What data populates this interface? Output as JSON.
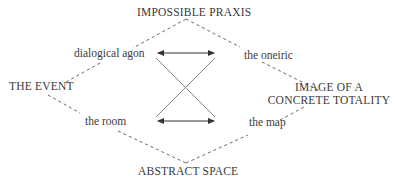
{
  "diagram": {
    "nodes": {
      "top": "IMPOSSIBLE PRAXIS",
      "left": "THE EVENT",
      "right_line1": "IMAGE OF A",
      "right_line2": "CONCRETE TOTALITY",
      "bottom": "ABSTRACT SPACE"
    },
    "edge_labels": {
      "upper_left": "dialogical agon",
      "upper_right": "the oneiric",
      "lower_left": "the room",
      "lower_right": "the map"
    },
    "edges": [
      {
        "from": "IMPOSSIBLE PRAXIS",
        "to": "THE EVENT",
        "style": "dashed",
        "label": "dialogical agon"
      },
      {
        "from": "IMPOSSIBLE PRAXIS",
        "to": "IMAGE OF A CONCRETE TOTALITY",
        "style": "dashed",
        "label": "the oneiric"
      },
      {
        "from": "THE EVENT",
        "to": "ABSTRACT SPACE",
        "style": "dashed",
        "label": "the room"
      },
      {
        "from": "IMAGE OF A CONCRETE TOTALITY",
        "to": "ABSTRACT SPACE",
        "style": "dashed",
        "label": "the map"
      },
      {
        "from": "dialogical agon",
        "to": "the oneiric",
        "style": "double-arrow"
      },
      {
        "from": "the room",
        "to": "the map",
        "style": "double-arrow"
      },
      {
        "from": "dialogical agon",
        "to": "the map",
        "style": "solid"
      },
      {
        "from": "the oneiric",
        "to": "the room",
        "style": "solid"
      }
    ]
  }
}
